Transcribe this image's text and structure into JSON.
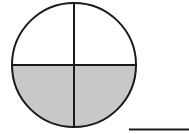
{
  "diagram": {
    "type": "fraction-circle",
    "parts_total": 4,
    "parts_shaded": 2,
    "shaded_region": "bottom-half",
    "colors": {
      "stroke": "#1a1a1a",
      "shade": "#c8c8c8",
      "background": "#ffffff"
    },
    "answer_blank": ""
  }
}
